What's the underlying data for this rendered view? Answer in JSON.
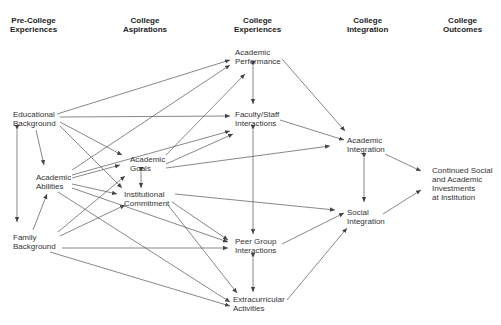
{
  "headers": {
    "precollege": "Pre-College\nExperiences",
    "aspirations": "College\nAspirations",
    "experiences": "College\nExperiences",
    "integration": "College\nIntegration",
    "outcomes": "College\nOutcomes"
  },
  "nodes": {
    "educational_background": "Educational\nBackground",
    "academic_abilities": "Academic\nAbilities",
    "family_background": "Family\nBackground",
    "academic_goals": "Academic\nGoals",
    "institutional_commitment": "Institutional\nCommitment",
    "academic_performance": "Academic\nPerformance",
    "faculty_staff_interactions": "Faculty/Staff\nInteractions",
    "peer_group_interactions": "Peer Group\nInteractions",
    "extracurricular_activities": "Extracurricular\nActivities",
    "academic_integration": "Academic\nIntegration",
    "social_integration": "Social\nIntegration",
    "continued_investments": "Continued Social\nand Academic\nInvestments\nat Institution"
  },
  "colors": {
    "line": "#444444",
    "text": "#333333"
  }
}
